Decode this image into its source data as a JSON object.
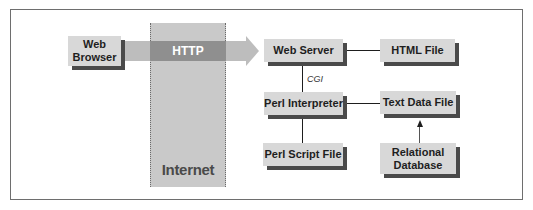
{
  "diagram": {
    "network_label": "Internet",
    "protocol_label": "HTTP",
    "edge_label_cgi": "CGI",
    "nodes": {
      "web_browser": "Web\nBrowser",
      "web_server": "Web Server",
      "html_file": "HTML File",
      "perl_interpreter": "Perl Interpreter",
      "text_data_file": "Text Data File",
      "perl_script_file": "Perl Script File",
      "relational_database": "Relational\nDatabase"
    },
    "edges": [
      {
        "from": "Web Browser",
        "to": "Web Server",
        "label": "HTTP",
        "type": "arrow"
      },
      {
        "from": "Web Server",
        "to": "HTML File",
        "type": "line"
      },
      {
        "from": "Web Server",
        "to": "Perl Interpreter",
        "label": "CGI",
        "type": "line"
      },
      {
        "from": "Perl Interpreter",
        "to": "Text Data File",
        "type": "line"
      },
      {
        "from": "Perl Interpreter",
        "to": "Perl Script File",
        "type": "line"
      },
      {
        "from": "Relational Database",
        "to": "Text Data File",
        "type": "arrow"
      }
    ],
    "colors": {
      "box_fill": "#d8d8d8",
      "box_shadow": "#4a4a4a",
      "internet_fill": "#c9c9c9",
      "http_band": "#8f8f8f",
      "arrow_fill": "#bdbdbd"
    }
  }
}
